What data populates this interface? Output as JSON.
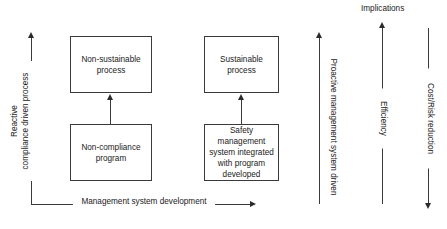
{
  "diagram": {
    "title_right": "Implications",
    "boxes": [
      {
        "id": "non-sustainable",
        "line1": "Non-sustainable",
        "line2": "process"
      },
      {
        "id": "non-compliance",
        "line1": "Non-compliance",
        "line2": "program"
      },
      {
        "id": "sustainable",
        "line1": "Sustainable",
        "line2": "process"
      },
      {
        "id": "safety-mgmt",
        "line1": "Safety",
        "line2": "management",
        "line3": "system integrated",
        "line4": "with program",
        "line5": "developed"
      }
    ],
    "axes": {
      "left": {
        "line1": "Reactive",
        "line2": "compliance driven",
        "line3": "process",
        "direction": "up"
      },
      "bottom": {
        "label": "Management system development",
        "direction": "right"
      },
      "proactive": {
        "label": "Proactive management system driven",
        "direction": "up"
      },
      "efficiency": {
        "label": "Efficiency",
        "direction": "up"
      },
      "cost": {
        "label": "Cost/Risk reduction",
        "direction": "down"
      }
    },
    "colors": {
      "stroke": "#3a3a3a",
      "arrow": "#2b2b2b",
      "text": "#1a1a1a",
      "background": "#ffffff"
    }
  }
}
